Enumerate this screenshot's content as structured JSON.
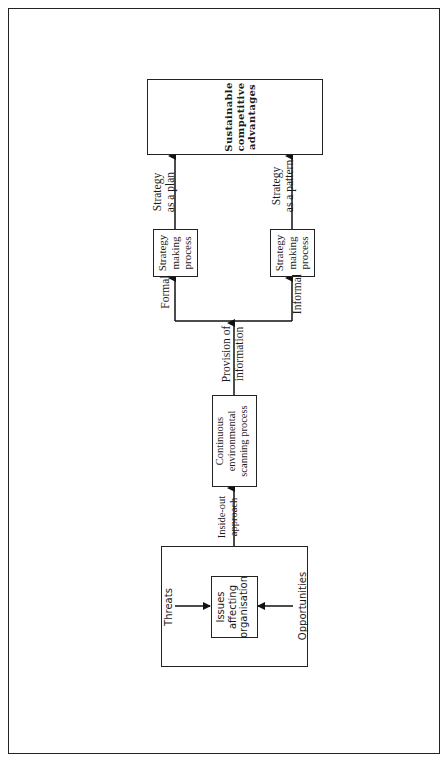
{
  "diagram": {
    "nodes": {
      "sustainable": {
        "lines": [
          "Sustainable",
          "competitive",
          "advantages"
        ]
      },
      "strategy_formal": {
        "lines": [
          "Strategy",
          "making",
          "process"
        ]
      },
      "strategy_informal": {
        "lines": [
          "Strategy",
          "making",
          "process"
        ]
      },
      "scanning": {
        "lines": [
          "Continuous",
          "environmental",
          "scanning process"
        ]
      },
      "issues": {
        "lines": [
          "Issues",
          "affecting",
          "organisation"
        ]
      }
    },
    "edge_labels": {
      "plan": [
        "Strategy",
        "as a plan"
      ],
      "pattern": [
        "Strategy",
        "as a pattern"
      ],
      "formal": "Formal",
      "informal": "Informal",
      "provision": [
        "Provision of",
        "information"
      ],
      "inside_out": [
        "Inside-out",
        "approach"
      ],
      "threats": "Threats",
      "opportunities": "Opportunities"
    }
  }
}
